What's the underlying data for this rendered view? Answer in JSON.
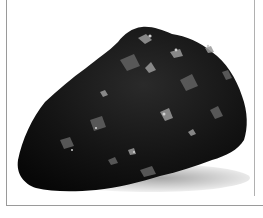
{
  "image": {
    "subject": "lump of coal",
    "background_color": "#ffffff",
    "rock_color": "#111111",
    "highlight_color": "#8a8a8a",
    "frame_color": "#9a9a9a"
  }
}
